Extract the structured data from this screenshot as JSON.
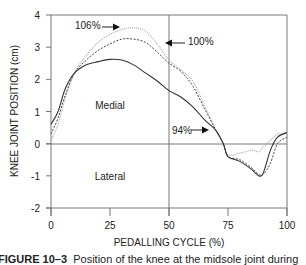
{
  "chart_data": {
    "type": "line",
    "title": "",
    "xlabel": "PEDALLING CYCLE (%)",
    "ylabel": "KNEE JOINT POSITION (cm)",
    "xlim": [
      0,
      100
    ],
    "ylim": [
      -2,
      4
    ],
    "xticks": [
      0,
      25,
      50,
      75,
      100
    ],
    "yticks": [
      -2,
      -1,
      0,
      1,
      2,
      3,
      4
    ],
    "grid": false,
    "reference_lines": {
      "y0": true,
      "x50": true
    },
    "region_labels": [
      {
        "text": "Medial",
        "x": 25,
        "y": 1.2
      },
      {
        "text": "Lateral",
        "x": 25,
        "y": -1.0
      }
    ],
    "annotations": [
      {
        "text": "106%",
        "series": "106%",
        "arrow": "right",
        "x": 11,
        "y": 3.55
      },
      {
        "text": "100%",
        "series": "100%",
        "arrow": "left",
        "x": 55,
        "y": 3.3
      },
      {
        "text": "94%",
        "series": "94%",
        "arrow": "right",
        "x": 62,
        "y": 0.4
      }
    ],
    "x": [
      0,
      3,
      6,
      10,
      15,
      20,
      25,
      30,
      35,
      40,
      45,
      50,
      55,
      60,
      65,
      70,
      73,
      75,
      80,
      85,
      88,
      90,
      93,
      96,
      100
    ],
    "series": [
      {
        "name": "94%",
        "style": "solid",
        "color": "#333333",
        "values": [
          0.6,
          1.0,
          1.7,
          2.2,
          2.45,
          2.55,
          2.62,
          2.6,
          2.45,
          2.2,
          1.95,
          1.65,
          1.45,
          1.15,
          0.75,
          0.4,
          0.0,
          -0.4,
          -0.55,
          -0.8,
          -1.0,
          -0.9,
          -0.2,
          0.2,
          0.35
        ]
      },
      {
        "name": "100%",
        "style": "dashed",
        "color": "#444444",
        "values": [
          0.3,
          0.8,
          1.5,
          2.2,
          2.6,
          2.9,
          3.1,
          3.25,
          3.25,
          3.15,
          2.85,
          2.5,
          2.25,
          1.8,
          1.1,
          0.4,
          0.0,
          -0.4,
          -0.5,
          -0.75,
          -0.95,
          -0.95,
          -0.6,
          0.0,
          0.2
        ]
      },
      {
        "name": "106%",
        "style": "dotted-light",
        "color": "#aaaaaa",
        "values": [
          0.1,
          0.6,
          1.4,
          2.2,
          2.75,
          3.15,
          3.4,
          3.55,
          3.6,
          3.5,
          3.1,
          2.6,
          2.3,
          1.95,
          1.2,
          0.4,
          0.0,
          -0.35,
          -0.3,
          -0.2,
          -0.25,
          -0.1,
          0.1,
          0.3,
          0.3
        ]
      }
    ]
  },
  "caption": {
    "label": "FIGURE 10–3",
    "text": "Position of the knee at the midsole joint during"
  }
}
